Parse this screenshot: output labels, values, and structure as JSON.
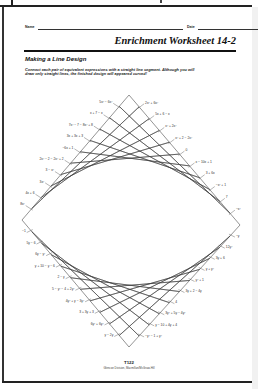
{
  "header": {
    "name_label": "Name",
    "date_label": "Date"
  },
  "title": "Enrichment Worksheet 14-2",
  "subtitle": "Making a Line Design",
  "instructions": "Connect each pair of equivalent expressions with a straight line segment. Although you will draw only straight lines, the finished design will appeared curved!",
  "design": {
    "upper_left_labels": [
      "5x² − 6x²",
      "x + 7 − x",
      "7x² − 7 − 8x² + 8",
      "3x + 3x + 3",
      "−6x + 1",
      "2x² − 2 − 2x² + 2",
      "3 − x²",
      "3x²",
      "4x + 6",
      "8x²"
    ],
    "upper_right_labels": [
      "2x² + 6x²",
      "5x + 6 − x",
      "x² + 2x²",
      "x² + 2 − 2x²",
      "0",
      "x − 10x + 1",
      "3 + 6x",
      "−x² + 1",
      "7",
      "−x²"
    ],
    "lower_left_labels": [
      "−1",
      "5y − 6",
      "6y − y²",
      "y + 10 − y − 6",
      "2 − y",
      "5 − y² − 4 + 2y²",
      "4y² + y − 3y²",
      "3 + 3y + 3",
      "6y² + 6y²",
      "y − 2y"
    ],
    "lower_right_labels": [
      "−y",
      "12y²",
      "3y + 6",
      "y + y²",
      "y² + 1",
      "3y + 2 − 4y",
      "4",
      "3y² + 5y − 4y²",
      "y − 10 + 4y + 4",
      "−y² − 1 + y²"
    ],
    "line_color": "#3a3a3a"
  },
  "footer": {
    "page_number": "T122",
    "publisher": "Glencoe Division, Macmillan/McGraw-Hill"
  }
}
